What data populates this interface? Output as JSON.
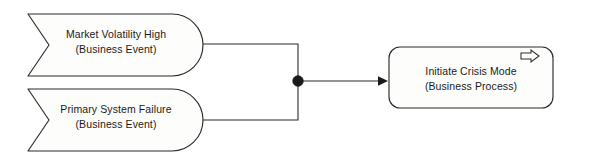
{
  "diagram": {
    "type": "archimate-business-layer-diagram",
    "background_color": "#ffffff",
    "line_color": "#2b2b2b",
    "shape_fill": "#fdfdfc",
    "text_color": "#1a1a1a",
    "nodes": [
      {
        "id": "market-volatility-high",
        "kind": "business-event",
        "shape": "event-flag",
        "label": "Market Volatility High",
        "sublabel": "(Business Event)"
      },
      {
        "id": "primary-system-failure",
        "kind": "business-event",
        "shape": "event-flag",
        "label": "Primary System Failure",
        "sublabel": "(Business Event)"
      },
      {
        "id": "initiate-crisis-mode",
        "kind": "business-process",
        "shape": "rounded-rectangle",
        "label": "Initiate Crisis Mode",
        "sublabel": "(Business Process)",
        "icon": "process-arrow-icon"
      }
    ],
    "junction": {
      "id": "and-junction",
      "kind": "and-junction",
      "style": "filled-dot"
    },
    "connectors": [
      {
        "id": "connector-market-volatility-to-junction",
        "from": "market-volatility-high",
        "to": "and-junction",
        "routing": "orthogonal",
        "arrow": "none"
      },
      {
        "id": "connector-primary-failure-to-junction",
        "from": "primary-system-failure",
        "to": "and-junction",
        "routing": "orthogonal",
        "arrow": "none"
      },
      {
        "id": "connector-junction-to-process",
        "from": "and-junction",
        "to": "initiate-crisis-mode",
        "routing": "straight",
        "arrow": "filled-triangle"
      }
    ]
  }
}
